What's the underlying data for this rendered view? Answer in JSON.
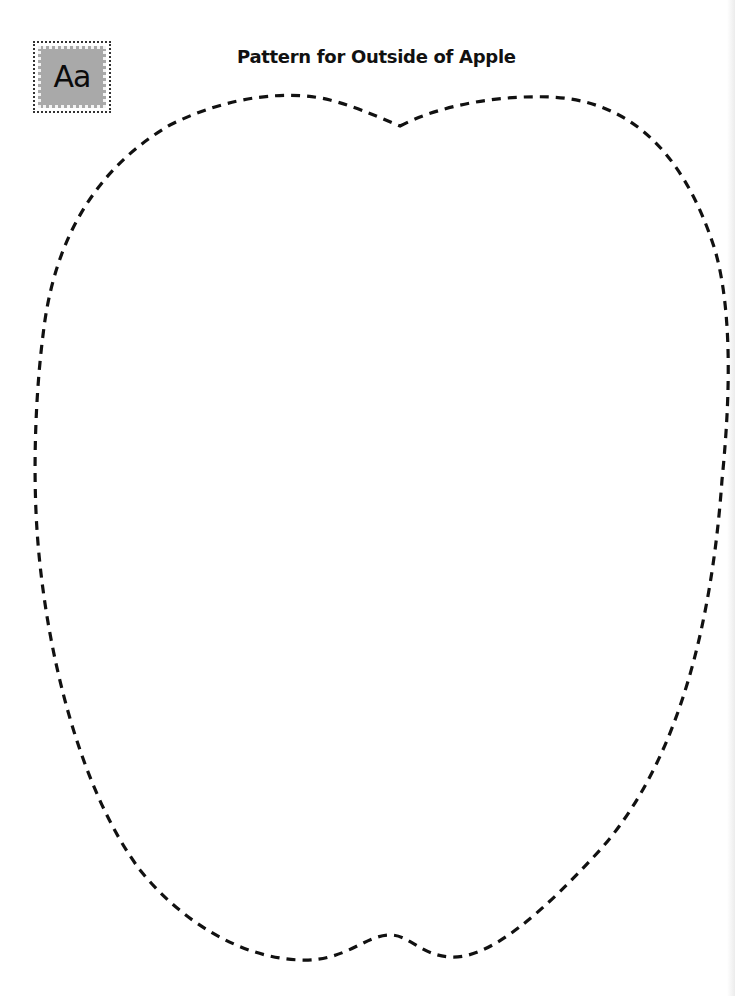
{
  "page": {
    "title": "Pattern for Outside of Apple",
    "badge": {
      "label": "Aa",
      "icon": "alphabet-badge-icon",
      "fill_color": "#a9a9a9"
    },
    "outline": {
      "shape": "apple",
      "style": "dashed",
      "color": "#111111"
    }
  }
}
